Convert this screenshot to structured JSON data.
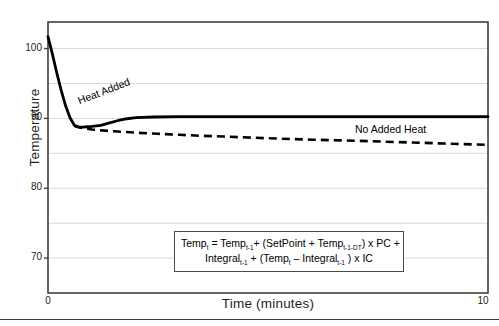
{
  "chart_data": {
    "type": "line",
    "title": "",
    "xlabel": "Time (minutes)",
    "ylabel": "Temperature",
    "xlim": [
      0,
      10
    ],
    "ylim": [
      65,
      103.8
    ],
    "xticks": [
      "0",
      "10"
    ],
    "yticks": [
      "70",
      "80",
      "90",
      "100"
    ],
    "ytick_values": [
      70,
      80,
      90,
      100
    ],
    "gridlines": {
      "y_minor_step": 5,
      "visible": true,
      "color": "#d9d9d9"
    },
    "legend": {
      "position": "inline-annotations"
    },
    "series": [
      {
        "name": "Heat Added",
        "style": "solid",
        "color": "#000000",
        "label_rotation_deg": -21,
        "x": [
          0.0,
          0.1,
          0.2,
          0.3,
          0.4,
          0.5,
          0.6,
          0.7,
          0.8,
          0.9,
          1.0,
          1.2,
          1.4,
          1.6,
          1.8,
          2.0,
          2.4,
          3.0,
          4.0,
          5.0,
          6.0,
          7.0,
          8.0,
          9.0,
          10.0
        ],
        "y": [
          101.7,
          99.2,
          96.5,
          94.0,
          91.8,
          90.1,
          89.0,
          88.75,
          88.75,
          88.8,
          88.85,
          89.0,
          89.35,
          89.7,
          89.95,
          90.1,
          90.2,
          90.25,
          90.25,
          90.25,
          90.25,
          90.25,
          90.25,
          90.25,
          90.25
        ]
      },
      {
        "name": "No Added Heat",
        "style": "dashed",
        "color": "#000000",
        "x": [
          0.6,
          0.8,
          1.0,
          1.5,
          2.0,
          2.5,
          3.0,
          3.5,
          4.0,
          5.0,
          6.0,
          7.0,
          8.0,
          9.0,
          10.0
        ],
        "y": [
          88.9,
          88.6,
          88.4,
          88.15,
          87.95,
          87.8,
          87.65,
          87.5,
          87.4,
          87.15,
          86.95,
          86.8,
          86.6,
          86.4,
          86.2
        ]
      }
    ],
    "annotations": [
      {
        "name": "heat-added-label",
        "text": "Heat Added"
      },
      {
        "name": "no-added-heat-label",
        "text": "No Added Heat"
      }
    ]
  },
  "axes": {
    "y_title": "Temperature",
    "x_title": "Time (minutes)",
    "y_labels": [
      "100",
      "90",
      "80",
      "70"
    ],
    "x_labels": [
      "0",
      "10"
    ]
  },
  "formula": {
    "line1_a": "Temp",
    "line1_a_sub": "t",
    "line1_b": " = Temp",
    "line1_b_sub": "t-1",
    "line1_c": "+ (SetPoint + Temp",
    "line1_c_sub": "t-1-DT",
    "line1_d": ") x PC +",
    "line2_a": "Integral",
    "line2_a_sub": "t-1",
    "line2_b": " + (Temp",
    "line2_b_sub": "t",
    "line2_c": " – Integral",
    "line2_c_sub": "t-1",
    "line2_d": " ) x IC",
    "full_text": "Temp_t = Temp_t-1 + (SetPoint + Temp_t-1-DT) x PC + Integral_t-1 + (Temp_t – Integral_t-1 ) x IC"
  },
  "colors": {
    "line": "#000000",
    "grid": "#d9d9d9",
    "axis": "#3f3f3f",
    "text": "#231f20",
    "background": "#ffffff"
  }
}
